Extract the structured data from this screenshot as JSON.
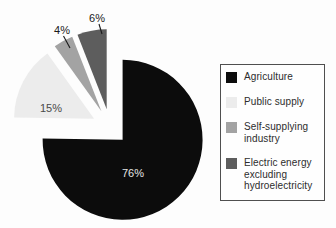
{
  "chart_data": {
    "type": "pie",
    "title": "",
    "labels": [
      "Agriculture",
      "Public supply",
      "Self-supplying industry",
      "Electric energy excluding hydroelectricity"
    ],
    "values": [
      76,
      15,
      4,
      6
    ],
    "value_labels": [
      "76%",
      "15%",
      "4%",
      "6%"
    ],
    "unit": "%",
    "colors": [
      "#0c0c0c",
      "#ececec",
      "#a3a3a3",
      "#5d5d5d"
    ],
    "slice_label_colors": [
      "#e6e6e6",
      "#4a4a4a",
      "#1a1a1a",
      "#1a1a1a"
    ],
    "legend_position": "right",
    "exploded": true
  }
}
